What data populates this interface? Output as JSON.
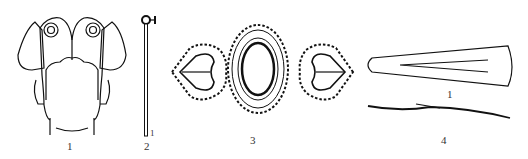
{
  "figure": {
    "items": [
      {
        "id": "1",
        "label": "1",
        "description": "head with hair ornaments (back view)"
      },
      {
        "id": "2",
        "label": "2",
        "description": "hairpin with ring head"
      },
      {
        "id": "3",
        "label": "3",
        "description": "beaded oval ornament with heart-shaped side pieces"
      },
      {
        "id": "4",
        "label": "4",
        "description": "tapered hairpin, top and side views"
      }
    ],
    "sub_label_4": "1",
    "sub_label_2": "1"
  }
}
